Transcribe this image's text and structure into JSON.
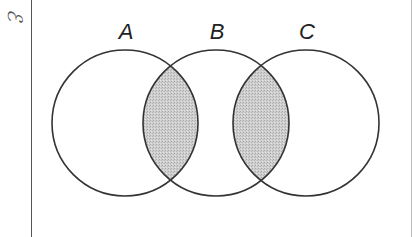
{
  "diagram": {
    "type": "venn",
    "universal_set_symbol": "ℰ",
    "sets": [
      {
        "label": "A",
        "cx": 125,
        "cy": 123,
        "r": 73,
        "label_x": 126,
        "label_y": 22
      },
      {
        "label": "B",
        "cx": 216,
        "cy": 123,
        "r": 73,
        "label_x": 217,
        "label_y": 22
      },
      {
        "label": "C",
        "cx": 306,
        "cy": 123,
        "r": 73,
        "label_x": 307,
        "label_y": 22
      }
    ],
    "shaded_regions": [
      "A ∩ B",
      "B ∩ C"
    ],
    "colors": {
      "outline": "#333333",
      "shading": "#c8c8c8",
      "background": "#ffffff"
    }
  }
}
